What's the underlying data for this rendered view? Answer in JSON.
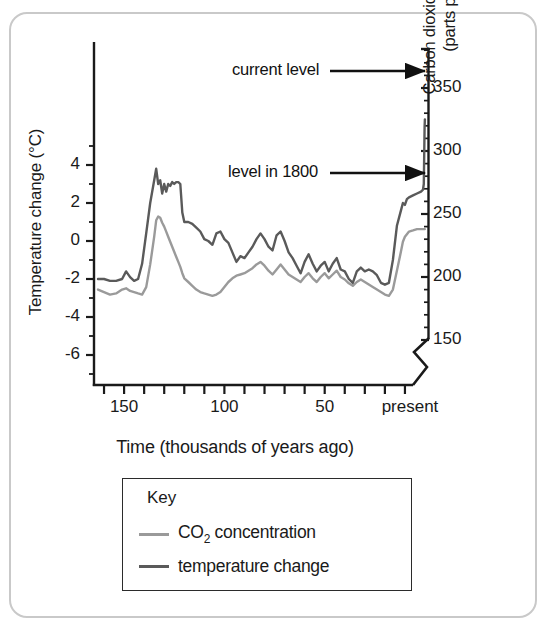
{
  "figure": {
    "border_color": "#c9c9c9"
  },
  "axes": {
    "left": {
      "title": "Temperature change (°C)",
      "ticks": [
        "4",
        "2",
        "0",
        "-2",
        "-4",
        "-6"
      ],
      "tick_values": [
        4,
        2,
        0,
        -2,
        -4,
        -6
      ],
      "range": [
        -7.5,
        6.5
      ]
    },
    "right": {
      "title_line1": "Carbon dioxide concentration",
      "title_line2": "(parts per million)",
      "ticks": [
        "350",
        "300",
        "250",
        "200",
        "150"
      ],
      "tick_values": [
        350,
        300,
        250,
        200,
        150
      ],
      "range": [
        140,
        390
      ],
      "has_axis_break": true
    },
    "bottom": {
      "title": "Time (thousands of years ago)",
      "ticks": [
        "150",
        "100",
        "50",
        "present"
      ],
      "tick_values": [
        150,
        100,
        50,
        0
      ],
      "range": [
        165,
        0
      ],
      "minor_tick_step": 10
    }
  },
  "annotations": [
    {
      "label": "current level",
      "target_ppm": 370,
      "id": "current-level"
    },
    {
      "label": "level in 1800",
      "target_ppm": 280,
      "id": "level-1800"
    }
  ],
  "key": {
    "title": "Key",
    "items": [
      {
        "label_html": "CO<sub>2</sub> concentration",
        "label": "CO2 concentration",
        "color": "#9a9a9a"
      },
      {
        "label_html": "temperature change",
        "label": "temperature change",
        "color": "#5a5a5a"
      }
    ]
  },
  "colors": {
    "co2_line": "#9a9a9a",
    "temperature_line": "#5a5a5a",
    "axis": "#1a1a1a",
    "text": "#1a1a1a"
  },
  "chart_data": {
    "type": "line",
    "title": "",
    "xlabel": "Time (thousands of years ago)",
    "ylabel": "Temperature change (°C)",
    "ylabel_secondary": "Carbon dioxide concentration (parts per million)",
    "xlim": [
      165,
      0
    ],
    "ylim": [
      -7.5,
      6.5
    ],
    "ylim_secondary": [
      140,
      390
    ],
    "grid": false,
    "legend_position": "below-plot",
    "x_note": "x in thousands of years ago, decreasing left to right to present",
    "series": [
      {
        "name": "temperature change",
        "axis": "left",
        "units": "°C",
        "color": "#5a5a5a",
        "points": [
          [
            163,
            -2.0
          ],
          [
            160,
            -2.0
          ],
          [
            157,
            -2.1
          ],
          [
            154,
            -2.1
          ],
          [
            151,
            -2.0
          ],
          [
            149,
            -1.6
          ],
          [
            147,
            -1.9
          ],
          [
            145,
            -2.1
          ],
          [
            143,
            -2.0
          ],
          [
            141,
            -1.2
          ],
          [
            139,
            0.4
          ],
          [
            137,
            2.0
          ],
          [
            135,
            3.2
          ],
          [
            134,
            3.8
          ],
          [
            133,
            3.0
          ],
          [
            132,
            3.2
          ],
          [
            131,
            2.5
          ],
          [
            130,
            3.0
          ],
          [
            129,
            2.6
          ],
          [
            128,
            3.0
          ],
          [
            127,
            2.9
          ],
          [
            126,
            3.1
          ],
          [
            125,
            3.0
          ],
          [
            124,
            3.1
          ],
          [
            123,
            3.1
          ],
          [
            122,
            3.0
          ],
          [
            121,
            1.5
          ],
          [
            120,
            1.0
          ],
          [
            118,
            1.0
          ],
          [
            116,
            0.9
          ],
          [
            114,
            0.7
          ],
          [
            112,
            0.5
          ],
          [
            110,
            0.1
          ],
          [
            108,
            0.0
          ],
          [
            106,
            -0.2
          ],
          [
            104,
            0.4
          ],
          [
            102,
            0.5
          ],
          [
            100,
            0.1
          ],
          [
            98,
            -0.1
          ],
          [
            96,
            -0.6
          ],
          [
            94,
            -1.1
          ],
          [
            92,
            -0.8
          ],
          [
            90,
            -0.9
          ],
          [
            88,
            -0.6
          ],
          [
            86,
            -0.3
          ],
          [
            84,
            0.1
          ],
          [
            82,
            0.4
          ],
          [
            80,
            0.1
          ],
          [
            78,
            -0.3
          ],
          [
            76,
            -0.5
          ],
          [
            74,
            0.3
          ],
          [
            72,
            0.5
          ],
          [
            70,
            0.0
          ],
          [
            68,
            -0.6
          ],
          [
            66,
            -0.9
          ],
          [
            64,
            -1.3
          ],
          [
            62,
            -1.7
          ],
          [
            60,
            -1.1
          ],
          [
            58,
            -0.7
          ],
          [
            56,
            -1.2
          ],
          [
            54,
            -1.6
          ],
          [
            52,
            -1.3
          ],
          [
            50,
            -1.1
          ],
          [
            48,
            -1.6
          ],
          [
            46,
            -1.2
          ],
          [
            44,
            -0.9
          ],
          [
            42,
            -1.5
          ],
          [
            40,
            -1.6
          ],
          [
            38,
            -2.0
          ],
          [
            36,
            -2.2
          ],
          [
            34,
            -1.6
          ],
          [
            32,
            -1.4
          ],
          [
            30,
            -1.6
          ],
          [
            28,
            -1.5
          ],
          [
            26,
            -1.6
          ],
          [
            24,
            -1.8
          ],
          [
            22,
            -2.2
          ],
          [
            20,
            -2.3
          ],
          [
            18,
            -2.2
          ],
          [
            16,
            -1.0
          ],
          [
            14,
            0.8
          ],
          [
            12,
            1.6
          ],
          [
            11,
            2.0
          ],
          [
            10,
            1.9
          ],
          [
            9,
            2.2
          ],
          [
            8,
            2.3
          ],
          [
            6,
            2.4
          ],
          [
            4,
            2.5
          ],
          [
            2,
            2.6
          ],
          [
            1,
            2.7
          ],
          [
            0.6,
            3.0
          ],
          [
            0.4,
            4.5
          ],
          [
            0.2,
            6.0
          ],
          [
            0.05,
            6.4
          ]
        ]
      },
      {
        "name": "CO2 concentration",
        "axis": "right",
        "units": "ppm",
        "color": "#9a9a9a",
        "points": [
          [
            163,
            190
          ],
          [
            160,
            188
          ],
          [
            157,
            186
          ],
          [
            154,
            187
          ],
          [
            151,
            190
          ],
          [
            149,
            191
          ],
          [
            147,
            189
          ],
          [
            145,
            188
          ],
          [
            143,
            187
          ],
          [
            141,
            186
          ],
          [
            139,
            192
          ],
          [
            137,
            210
          ],
          [
            135,
            232
          ],
          [
            134,
            245
          ],
          [
            133,
            248
          ],
          [
            132,
            247
          ],
          [
            131,
            243
          ],
          [
            130,
            240
          ],
          [
            129,
            236
          ],
          [
            128,
            232
          ],
          [
            127,
            228
          ],
          [
            126,
            224
          ],
          [
            125,
            220
          ],
          [
            124,
            216
          ],
          [
            123,
            212
          ],
          [
            122,
            208
          ],
          [
            121,
            203
          ],
          [
            120,
            199
          ],
          [
            118,
            196
          ],
          [
            116,
            193
          ],
          [
            114,
            190
          ],
          [
            112,
            188
          ],
          [
            110,
            187
          ],
          [
            108,
            186
          ],
          [
            106,
            185
          ],
          [
            104,
            186
          ],
          [
            102,
            188
          ],
          [
            100,
            192
          ],
          [
            98,
            196
          ],
          [
            96,
            199
          ],
          [
            94,
            201
          ],
          [
            92,
            202
          ],
          [
            90,
            203
          ],
          [
            88,
            205
          ],
          [
            86,
            207
          ],
          [
            84,
            210
          ],
          [
            82,
            212
          ],
          [
            80,
            209
          ],
          [
            78,
            205
          ],
          [
            76,
            202
          ],
          [
            74,
            206
          ],
          [
            72,
            210
          ],
          [
            70,
            206
          ],
          [
            68,
            202
          ],
          [
            66,
            200
          ],
          [
            64,
            198
          ],
          [
            62,
            196
          ],
          [
            60,
            200
          ],
          [
            58,
            203
          ],
          [
            56,
            199
          ],
          [
            54,
            196
          ],
          [
            52,
            200
          ],
          [
            50,
            203
          ],
          [
            48,
            199
          ],
          [
            46,
            202
          ],
          [
            44,
            205
          ],
          [
            42,
            200
          ],
          [
            40,
            198
          ],
          [
            38,
            195
          ],
          [
            36,
            193
          ],
          [
            34,
            196
          ],
          [
            32,
            198
          ],
          [
            30,
            196
          ],
          [
            28,
            194
          ],
          [
            26,
            192
          ],
          [
            24,
            190
          ],
          [
            22,
            188
          ],
          [
            20,
            186
          ],
          [
            18,
            185
          ],
          [
            16,
            190
          ],
          [
            14,
            205
          ],
          [
            12,
            220
          ],
          [
            11,
            228
          ],
          [
            10,
            232
          ],
          [
            9,
            234
          ],
          [
            8,
            236
          ],
          [
            6,
            237
          ],
          [
            4,
            238
          ],
          [
            2,
            238
          ],
          [
            1,
            238
          ],
          [
            0.5,
            238
          ],
          [
            0.1,
            238
          ]
        ]
      }
    ],
    "annotations": [
      {
        "text": "current level",
        "points_to_ppm": 370
      },
      {
        "text": "level in 1800",
        "points_to_ppm": 280
      }
    ]
  }
}
